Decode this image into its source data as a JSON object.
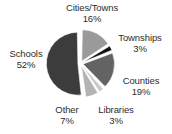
{
  "chart_data": {
    "type": "pie",
    "title": "",
    "subtitle": "",
    "xlabel": "",
    "ylabel": "",
    "legend_position": "labels-outside",
    "grid": false,
    "units": "percent",
    "start_angle_deg": 0,
    "direction": "clockwise",
    "exploded": true,
    "categories": [
      "Cities/Towns",
      "Townships",
      "Counties",
      "Libraries",
      "Other",
      "Schools"
    ],
    "values": [
      16,
      3,
      19,
      3,
      7,
      52
    ],
    "slices": [
      {
        "label": "Cities/Towns",
        "value": 16,
        "value_text": "16%",
        "color": "#9a9a9a"
      },
      {
        "label": "Townships",
        "value": 3,
        "value_text": "3%",
        "color": "#101010"
      },
      {
        "label": "Counties",
        "value": 19,
        "value_text": "19%",
        "color": "#636363"
      },
      {
        "label": "Libraries",
        "value": 3,
        "value_text": "3%",
        "color": "#c9c9c9"
      },
      {
        "label": "Other",
        "value": 7,
        "value_text": "7%",
        "color": "#b3b3b3"
      },
      {
        "label": "Schools",
        "value": 52,
        "value_text": "52%",
        "color": "#3c3c3c"
      }
    ]
  },
  "labels": {
    "cities": {
      "name": "Cities/Towns",
      "pct": "16%"
    },
    "townships": {
      "name": "Townships",
      "pct": "3%"
    },
    "counties": {
      "name": "Counties",
      "pct": "19%"
    },
    "libraries": {
      "name": "Libraries",
      "pct": "3%"
    },
    "other": {
      "name": "Other",
      "pct": "7%"
    },
    "schools": {
      "name": "Schools",
      "pct": "52%"
    }
  },
  "colors": {
    "background": "#ffffff",
    "text": "#2e2e2e",
    "slice_gap": "#ffffff"
  }
}
